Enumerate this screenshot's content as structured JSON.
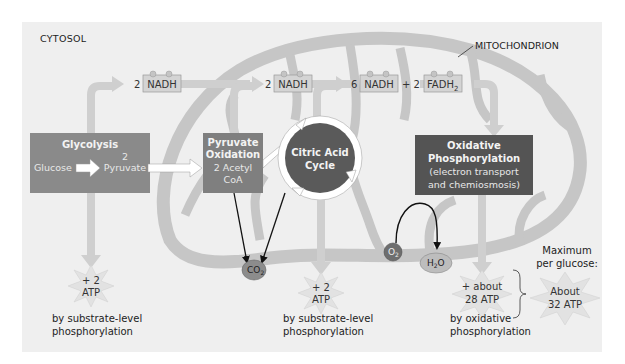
{
  "diagram": {
    "title_region": "CYTOSOL",
    "organelle_label": "MITOCHONDRION",
    "colors": {
      "panel_bg": "#efefef",
      "mito_fill": "#c9c9c9",
      "pathway_arrow": "#cfcfcf",
      "glycolysis_box": "#8a8a8a",
      "pyruvate_box": "#7f7f7f",
      "citric_circle": "#5a5a5a",
      "oxphos_box": "#545454",
      "carrier_box": "#d4d4d4",
      "atp_burst": "#e2e2e2",
      "co2": "#8c8c8c",
      "o2": "#6e6e6e",
      "h2o": "#bdbdbd"
    },
    "stages": [
      {
        "id": "glycolysis",
        "title": "Glycolysis",
        "input": "Glucose",
        "output_line1": "2",
        "output_line2": "Pyruvate"
      },
      {
        "id": "pyruvate-oxidation",
        "title_line1": "Pyruvate",
        "title_line2": "Oxidation",
        "output_line1": "2 Acetyl",
        "output_line2": "CoA"
      },
      {
        "id": "citric-acid-cycle",
        "title_line1": "Citric Acid",
        "title_line2": "Cycle"
      },
      {
        "id": "oxidative-phosphorylation",
        "title_line1": "Oxidative",
        "title_line2": "Phosphorylation",
        "sub_line1": "(electron transport",
        "sub_line2": "and chemiosmosis)"
      }
    ],
    "carriers": [
      {
        "coef": "2",
        "name": "NADH"
      },
      {
        "coef": "2",
        "name": "NADH"
      },
      {
        "coef": "6",
        "name": "NADH"
      },
      {
        "plus": "+ 2",
        "name": "FADH",
        "sub": "2"
      }
    ],
    "molecules": {
      "co2": {
        "base": "CO",
        "sub": "2"
      },
      "o2": {
        "base": "O",
        "sub": "2"
      },
      "h2o": {
        "pre": "H",
        "sub": "2",
        "post": "O"
      }
    },
    "atp_yields": [
      {
        "line1": "+ 2",
        "line2": "ATP",
        "caption1": "by substrate-level",
        "caption2": "phosphorylation"
      },
      {
        "line1": "+ 2",
        "line2": "ATP",
        "caption1": "by substrate-level",
        "caption2": "phosphorylation"
      },
      {
        "line1": "+ about",
        "line2": "28 ATP",
        "caption1": "by oxidative",
        "caption2": "phosphorylation"
      }
    ],
    "total": {
      "heading1": "Maximum",
      "heading2": "per glucose:",
      "line1": "About",
      "line2": "32 ATP"
    }
  }
}
